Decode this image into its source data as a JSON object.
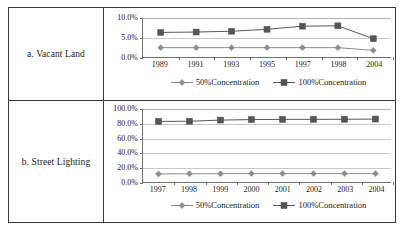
{
  "figure": {
    "rows": [
      {
        "label": "a. Vacant Land",
        "chart_key": "vacant_land"
      },
      {
        "label": "b. Street Lighting",
        "chart_key": "street_lighting"
      }
    ]
  },
  "legend": {
    "series_50_label": "50%Concentration",
    "series_100_label": "100%Concentration",
    "marker_50": "diamond",
    "marker_100": "square",
    "color_50": "#8c8c8c",
    "color_100": "#555555"
  },
  "chart_data": [
    {
      "key": "vacant_land",
      "type": "line",
      "title": "a. Vacant Land",
      "xlabel": "",
      "ylabel": "",
      "categories": [
        "1989",
        "1991",
        "1993",
        "1995",
        "1997",
        "1998",
        "2004"
      ],
      "ylim": [
        0,
        10
      ],
      "yticks": [
        0,
        5,
        10
      ],
      "ytick_labels": [
        "0.0%",
        "5.0%",
        "10.0%"
      ],
      "grid": true,
      "legend_position": "bottom",
      "series": [
        {
          "name": "50%Concentration",
          "marker": "diamond",
          "color": "#8c8c8c",
          "values": [
            2.4,
            2.4,
            2.4,
            2.4,
            2.4,
            2.4,
            1.7
          ]
        },
        {
          "name": "100%Concentration",
          "marker": "square",
          "color": "#555555",
          "values": [
            6.3,
            6.4,
            6.6,
            7.1,
            7.9,
            8.0,
            4.7
          ]
        }
      ]
    },
    {
      "key": "street_lighting",
      "type": "line",
      "title": "b. Street Lighting",
      "xlabel": "",
      "ylabel": "",
      "categories": [
        "1997",
        "1998",
        "1999",
        "2000",
        "2001",
        "2002",
        "2003",
        "2004"
      ],
      "ylim": [
        0,
        100
      ],
      "yticks": [
        0,
        20,
        40,
        60,
        80,
        100
      ],
      "ytick_labels": [
        "0.0%",
        "20.0%",
        "40.0%",
        "60.0%",
        "80.0%",
        "100.0%"
      ],
      "grid": true,
      "legend_position": "bottom",
      "series": [
        {
          "name": "50%Concentration",
          "marker": "diamond",
          "color": "#8c8c8c",
          "values": [
            11.0,
            11.2,
            11.4,
            11.5,
            11.5,
            11.5,
            11.5,
            11.5
          ]
        },
        {
          "name": "100%Concentration",
          "marker": "square",
          "color": "#555555",
          "values": [
            83.0,
            83.2,
            84.8,
            85.5,
            85.8,
            85.8,
            85.9,
            86.2
          ]
        }
      ]
    }
  ]
}
